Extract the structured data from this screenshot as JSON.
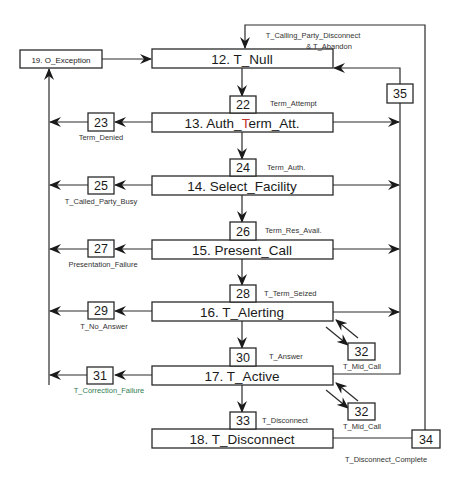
{
  "colors": {
    "line": "#2a2a2a",
    "text": "#1a1a1a",
    "highlight_T": "#c0392b",
    "correction_label": "#2e7d4f"
  },
  "exception": {
    "label": "19. O_Exception"
  },
  "states": {
    "t_null": {
      "label": "12. T_Null"
    },
    "auth_term_att": {
      "prefix": "13. Auth_",
      "highlight": "T",
      "suffix": "erm_Att."
    },
    "select_facility": {
      "label": "14. Select_Facility"
    },
    "present_call": {
      "label": "15. Present_Call"
    },
    "t_alerting": {
      "label": "16. T_Alerting"
    },
    "t_active": {
      "label": "17. T_Active"
    },
    "t_disconnect": {
      "label": "18. T_Disconnect"
    }
  },
  "forward_points": {
    "dp22": {
      "num": "22",
      "label": "Term_Attempt"
    },
    "dp24": {
      "num": "24",
      "label": "Term_Auth."
    },
    "dp26": {
      "num": "26",
      "label": "Term_Res_Avail."
    },
    "dp28": {
      "num": "28",
      "label": "T_Term_Seized"
    },
    "dp30": {
      "num": "30",
      "label": "T_Answer"
    },
    "dp33": {
      "num": "33",
      "label": "T_Disconnect"
    }
  },
  "failure_points": {
    "dp23": {
      "num": "23",
      "label": "Term_Denied"
    },
    "dp25": {
      "num": "25",
      "label": "T_Called_Party_Busy"
    },
    "dp27": {
      "num": "27",
      "label": "Presentation_Failure"
    },
    "dp29": {
      "num": "29",
      "label": "T_No_Answer"
    },
    "dp31": {
      "num": "31",
      "label": "T_Correction_Failure"
    }
  },
  "mid_call_points": {
    "alerting": {
      "num": "32",
      "label": "T_Mid_Call"
    },
    "active": {
      "num": "32",
      "label": "T_Mid_Call"
    }
  },
  "abandon_point": {
    "num": "35",
    "label_line1": "T_Calling_Party_Disconnect",
    "label_line2": "& T_Abandon"
  },
  "disconnect_complete_point": {
    "num": "34",
    "label": "T_Disconnect_Complete"
  }
}
